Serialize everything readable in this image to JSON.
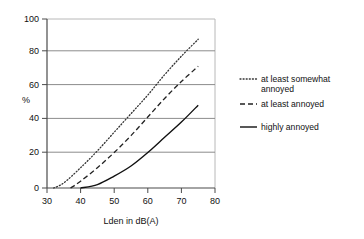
{
  "chart_data": {
    "type": "line",
    "title": "",
    "xlabel": "Lden in dB(A)",
    "ylabel": "%",
    "xlim": [
      30,
      80
    ],
    "ylim": [
      0,
      100
    ],
    "xticks": [
      30,
      40,
      50,
      60,
      70,
      80
    ],
    "yticks": [
      0,
      20,
      40,
      60,
      80,
      100
    ],
    "grid": "horizontal",
    "legend_position": "right",
    "series": [
      {
        "name": "at least somewhat annoyed",
        "style": "dotted",
        "color": "#333333",
        "x": [
          32,
          35,
          40,
          45,
          50,
          55,
          60,
          65,
          70,
          75
        ],
        "values": [
          0,
          3,
          12,
          22,
          33,
          44,
          55,
          67,
          78,
          88
        ]
      },
      {
        "name": "at least annoyed",
        "style": "dashed",
        "color": "#222222",
        "x": [
          37,
          40,
          45,
          50,
          55,
          60,
          65,
          70,
          75
        ],
        "values": [
          0,
          4,
          12,
          21,
          31,
          42,
          53,
          63,
          72
        ]
      },
      {
        "name": "highly annoyed",
        "style": "solid",
        "color": "#111111",
        "x": [
          40,
          45,
          50,
          55,
          60,
          65,
          70,
          75
        ],
        "values": [
          0,
          2,
          7,
          13,
          21,
          30,
          39,
          49
        ]
      }
    ]
  },
  "axis": {
    "y_label": "%",
    "x_label": "Lden in dB(A)",
    "x_tick_labels": [
      "30",
      "40",
      "50",
      "60",
      "70",
      "80"
    ],
    "y_tick_labels": [
      "0",
      "20",
      "40",
      "60",
      "80",
      "100"
    ]
  },
  "legend": {
    "entries": [
      {
        "label_line1": "at least somewhat",
        "label_line2": "annoyed",
        "style": "dotted"
      },
      {
        "label_line1": "at least annoyed",
        "label_line2": "",
        "style": "dashed"
      },
      {
        "label_line1": "highly annoyed",
        "label_line2": "",
        "style": "solid"
      }
    ]
  },
  "colors": {
    "gridline": "#8c8c8c",
    "axis": "#5a5a5a",
    "plot_border": "#b5b5b5",
    "series_dotted": "#333333",
    "series_dashed": "#222222",
    "series_solid": "#111111",
    "background": "#ffffff"
  }
}
